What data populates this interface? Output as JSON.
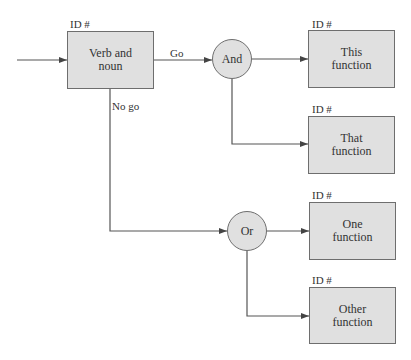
{
  "diagram": {
    "type": "functional flow block diagram",
    "colors": {
      "box_fill": "#e0e0e0",
      "stroke": "#6e6e6e",
      "line": "#555555",
      "text": "#333333"
    },
    "nodes": [
      {
        "id": "verb-noun",
        "kind": "function",
        "id_label": "ID #",
        "line1": "Verb and",
        "line2": "noun"
      },
      {
        "id": "and-gate",
        "kind": "gate",
        "label": "And"
      },
      {
        "id": "or-gate",
        "kind": "gate",
        "label": "Or"
      },
      {
        "id": "this-function",
        "kind": "function",
        "id_label": "ID #",
        "line1": "This",
        "line2": "function"
      },
      {
        "id": "that-function",
        "kind": "function",
        "id_label": "ID #",
        "line1": "That",
        "line2": "function"
      },
      {
        "id": "one-function",
        "kind": "function",
        "id_label": "ID #",
        "line1": "One",
        "line2": "function"
      },
      {
        "id": "other-function",
        "kind": "function",
        "id_label": "ID #",
        "line1": "Other",
        "line2": "function"
      }
    ],
    "edges": [
      {
        "from": "input",
        "to": "verb-noun",
        "label": ""
      },
      {
        "from": "verb-noun",
        "to": "and-gate",
        "label": "Go"
      },
      {
        "from": "verb-noun",
        "to": "or-gate",
        "label": "No go"
      },
      {
        "from": "and-gate",
        "to": "this-function",
        "label": ""
      },
      {
        "from": "and-gate",
        "to": "that-function",
        "label": ""
      },
      {
        "from": "or-gate",
        "to": "one-function",
        "label": ""
      },
      {
        "from": "or-gate",
        "to": "other-function",
        "label": ""
      }
    ]
  }
}
